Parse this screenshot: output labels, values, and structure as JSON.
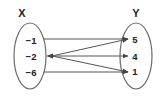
{
  "diagram": {
    "type": "mapping",
    "domain": {
      "label": "X",
      "values": [
        "−1",
        "−2",
        "−6"
      ]
    },
    "range": {
      "label": "Y",
      "values": [
        "5",
        "4",
        "1"
      ]
    },
    "mappings": [
      {
        "from": "−1",
        "to": "5"
      },
      {
        "from": "−2",
        "to": "5"
      },
      {
        "from": "−2",
        "to": "4"
      },
      {
        "from": "−2",
        "to": "1"
      },
      {
        "from": "−6",
        "to": "1"
      }
    ],
    "colors": {
      "ellipse": "#666666",
      "arrow": "#555555",
      "text": "#222222"
    }
  }
}
